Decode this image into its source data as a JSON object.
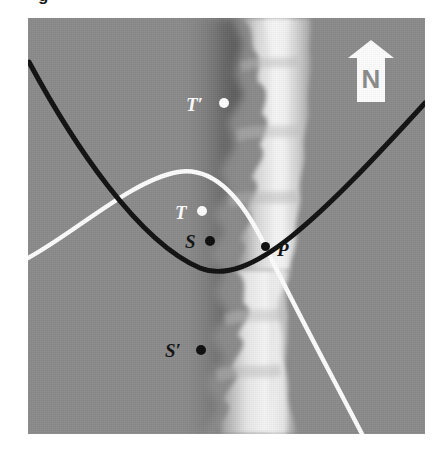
{
  "figure": {
    "clipped_caption_fragment": "g",
    "background_color": "#ffffff",
    "plate_color": "#8b8b8b"
  },
  "compass": {
    "label": "N",
    "icon": "north-arrow-icon",
    "arrow_color": "#fdfdfd",
    "letter_color": "#8b8b8b"
  },
  "curves": {
    "black_curve": {
      "name": "black-parabola-curve",
      "color": "#111111",
      "description": "upward-opening parabolic curve"
    },
    "white_curve": {
      "name": "white-arc-curve",
      "color": "#fdfdfd",
      "description": "arc peaking left of centre then descending steeply to bottom"
    }
  },
  "fault": {
    "name": "fault-ridge",
    "highlight_color": "#f2f2f2",
    "shadow_color": "#5d5d5d"
  },
  "points": [
    {
      "id": "t-prime",
      "label": "T′",
      "tone": "light",
      "label_x": 158,
      "label_y": 77,
      "dot_x": 196,
      "dot_y": 85,
      "dot_r": 5
    },
    {
      "id": "t",
      "label": "T",
      "tone": "light",
      "label_x": 147,
      "label_y": 185,
      "dot_x": 174,
      "dot_y": 192,
      "dot_r": 5
    },
    {
      "id": "s",
      "label": "S",
      "tone": "dark",
      "label_x": 157,
      "label_y": 214,
      "dot_x": 182,
      "dot_y": 222,
      "dot_r": 5
    },
    {
      "id": "s-prime",
      "label": "S′",
      "tone": "dark",
      "label_x": 137,
      "label_y": 323,
      "dot_x": 173,
      "dot_y": 331,
      "dot_r": 5
    },
    {
      "id": "p",
      "label": "P",
      "tone": "dark",
      "label_x": 250,
      "label_y": 224,
      "dot_x": 237,
      "dot_y": 228,
      "dot_r": 4
    }
  ]
}
